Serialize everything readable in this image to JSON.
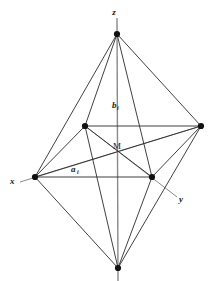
{
  "figure": {
    "background_color": "#ffffff",
    "line_color": "#2b2b2b",
    "axis_color": "#6e6e6e",
    "vertex_color": "#111111",
    "text_color": "#1a1a1a",
    "width": 213,
    "height": 281
  },
  "labels": {
    "axis_z": "z",
    "axis_x": "x",
    "axis_y": "y",
    "center": "M",
    "edge_b_main": "b",
    "edge_b_sub": "i",
    "edge_a_main": "a",
    "edge_a_sub": "i"
  },
  "vertices": [
    {
      "name": "z-apex-top",
      "x": 117,
      "y": 34,
      "label": "z"
    },
    {
      "name": "z-apex-bottom",
      "x": 118,
      "y": 268,
      "label": ""
    },
    {
      "name": "x-vertex-left",
      "x": 35,
      "y": 177,
      "label": "x"
    },
    {
      "name": "right-vertex",
      "x": 201,
      "y": 126,
      "label": ""
    },
    {
      "name": "back-vertex-upper",
      "x": 85,
      "y": 126,
      "label": ""
    },
    {
      "name": "y-vertex-front",
      "x": 152,
      "y": 177,
      "label": "y"
    },
    {
      "name": "center-M",
      "x": 117,
      "y": 148,
      "label": "M"
    }
  ],
  "axes": [
    {
      "name": "z-axis",
      "x1": 117,
      "y1": 18,
      "x2": 118,
      "y2": 281
    },
    {
      "name": "x-axis",
      "x1": 20,
      "y1": 182,
      "x2": 201,
      "y2": 126
    },
    {
      "name": "y-axis",
      "x1": 85,
      "y1": 126,
      "x2": 177,
      "y2": 197
    }
  ],
  "edges": [
    {
      "name": "top-to-left",
      "x1": 117,
      "y1": 34,
      "x2": 35,
      "y2": 177
    },
    {
      "name": "top-to-right",
      "x1": 117,
      "y1": 34,
      "x2": 201,
      "y2": 126
    },
    {
      "name": "top-to-back",
      "x1": 117,
      "y1": 34,
      "x2": 85,
      "y2": 126
    },
    {
      "name": "top-to-front",
      "x1": 117,
      "y1": 34,
      "x2": 152,
      "y2": 177
    },
    {
      "name": "bottom-to-left",
      "x1": 118,
      "y1": 268,
      "x2": 35,
      "y2": 177
    },
    {
      "name": "bottom-to-right",
      "x1": 118,
      "y1": 268,
      "x2": 201,
      "y2": 126
    },
    {
      "name": "bottom-to-back",
      "x1": 118,
      "y1": 268,
      "x2": 85,
      "y2": 126
    },
    {
      "name": "bottom-to-front",
      "x1": 118,
      "y1": 268,
      "x2": 152,
      "y2": 177
    },
    {
      "name": "eq-back-to-right",
      "x1": 85,
      "y1": 126,
      "x2": 201,
      "y2": 126
    },
    {
      "name": "eq-right-to-front",
      "x1": 201,
      "y1": 126,
      "x2": 152,
      "y2": 177
    },
    {
      "name": "eq-front-to-left",
      "x1": 152,
      "y1": 177,
      "x2": 35,
      "y2": 177
    },
    {
      "name": "eq-left-to-back",
      "x1": 35,
      "y1": 177,
      "x2": 85,
      "y2": 126
    },
    {
      "name": "diag-back-to-front",
      "x1": 85,
      "y1": 126,
      "x2": 152,
      "y2": 177
    },
    {
      "name": "diag-left-to-right",
      "x1": 35,
      "y1": 177,
      "x2": 201,
      "y2": 126
    }
  ],
  "label_positions": {
    "z": {
      "x": 114,
      "y": 13
    },
    "x": {
      "x": 9,
      "y": 184
    },
    "y": {
      "x": 180,
      "y": 201
    },
    "M": {
      "x": 111,
      "y": 146
    },
    "b_i": {
      "x": 114,
      "y": 106
    },
    "a_i": {
      "x": 72,
      "y": 172
    }
  }
}
